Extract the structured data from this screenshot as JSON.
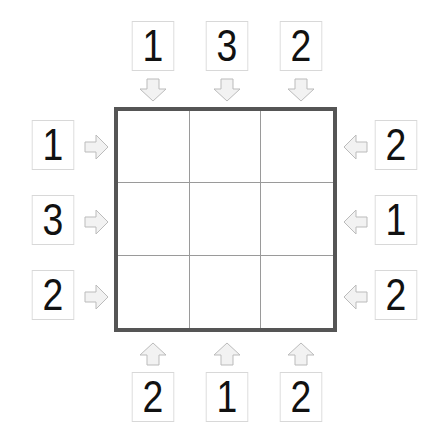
{
  "puzzle": {
    "type": "skyscrapers",
    "size": 3,
    "clues": {
      "top": [
        "1",
        "3",
        "2"
      ],
      "left": [
        "1",
        "3",
        "2"
      ],
      "right": [
        "2",
        "1",
        "2"
      ],
      "bottom": [
        "2",
        "1",
        "2"
      ]
    },
    "grid": [
      [
        "",
        "",
        ""
      ],
      [
        "",
        "",
        ""
      ],
      [
        "",
        "",
        ""
      ]
    ]
  },
  "colors": {
    "grid_border": "#555555",
    "grid_lines": "#9a9a9a",
    "arrow_fill": "#f2f2f2",
    "arrow_stroke": "#bbbbbb",
    "clue_text": "#111111"
  }
}
